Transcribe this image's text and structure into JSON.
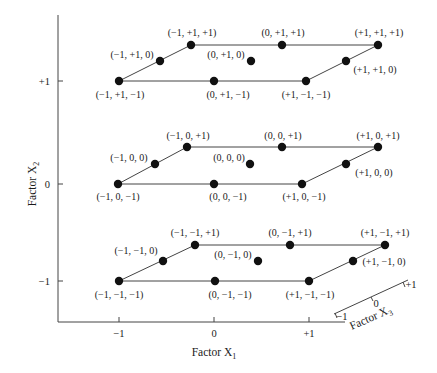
{
  "axes": {
    "x1": {
      "title": "Factor X",
      "sub": "1",
      "ticks": [
        "−1",
        "0",
        "+1"
      ]
    },
    "x2": {
      "title": "Factor X",
      "sub": "2",
      "ticks": [
        "+1",
        "0",
        "−1"
      ]
    },
    "x3": {
      "title": "Factor X",
      "sub": "3",
      "ticks": [
        "−1",
        "0",
        "+1"
      ]
    }
  },
  "layers": [
    {
      "name": "top",
      "points": [
        {
          "label": "(−1, +1, −1)"
        },
        {
          "label": "(0, +1, −1)"
        },
        {
          "label": "(+1, −1, −1)"
        },
        {
          "label": "(−1, +1, 0)"
        },
        {
          "label": "(0, +1, 0)"
        },
        {
          "label": "(+1, +1, 0)"
        },
        {
          "label": "(−1, +1, +1)"
        },
        {
          "label": "(0, +1, +1)"
        },
        {
          "label": "(+1, +1, +1)"
        }
      ]
    },
    {
      "name": "middle",
      "points": [
        {
          "label": "(−1, 0, −1)"
        },
        {
          "label": "(0, 0, −1)"
        },
        {
          "label": "(+1, 0, −1)"
        },
        {
          "label": "(−1, 0, 0)"
        },
        {
          "label": "(0, 0, 0)"
        },
        {
          "label": "(+1, 0, 0)"
        },
        {
          "label": "(−1, 0, +1)"
        },
        {
          "label": "(0, 0, +1)"
        },
        {
          "label": "(+1, 0, +1)"
        }
      ]
    },
    {
      "name": "bottom",
      "points": [
        {
          "label": "(−1, −1, −1)"
        },
        {
          "label": "(0, −1, −1)"
        },
        {
          "label": "(+1, −1, −1)"
        },
        {
          "label": "(−1, −1, 0)"
        },
        {
          "label": "(0, −1, 0)"
        },
        {
          "label": "(+1, −1, 0)"
        },
        {
          "label": "(−1, −1, +1)"
        },
        {
          "label": "(0, −1, +1)"
        },
        {
          "label": "(+1, −1, +1)"
        }
      ]
    }
  ]
}
